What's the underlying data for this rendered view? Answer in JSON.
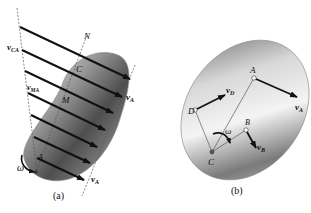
{
  "figure_a": {
    "caption": "(a)",
    "labels": {
      "N": "N",
      "C": "C",
      "M": "M",
      "A": "A",
      "vCA": "v",
      "vCA_sub": "CA",
      "vMA": "v",
      "vMA_sub": "MA",
      "vA_top": "v",
      "vA_top_sub": "A",
      "vA_bottom": "v",
      "vA_bottom_sub": "A",
      "omega": "ω"
    }
  },
  "figure_b": {
    "caption": "(b)",
    "labels": {
      "A": "A",
      "D": "D",
      "B": "B",
      "C": "C",
      "vD": "v",
      "vD_sub": "D",
      "vA": "v",
      "vA_sub": "A",
      "vB": "v",
      "vB_sub": "B",
      "omega": "ω"
    }
  },
  "colors": {
    "body_dark": "#5a5a5a",
    "body_light": "#e6e6e6",
    "arrow": "#111111",
    "dashed": "#555555"
  }
}
